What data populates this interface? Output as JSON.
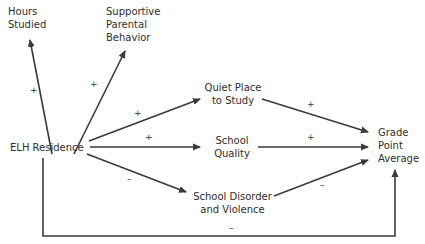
{
  "nodes": {
    "hours_studied": {
      "line1": "Hours",
      "line2": "Studied"
    },
    "supportive_parental": {
      "line1": "Supportive",
      "line2": "Parental",
      "line3": "Behavior"
    },
    "elh_residence": {
      "label": "ELH Residence"
    },
    "quiet_place": {
      "line1": "Quiet Place",
      "line2": "to Study"
    },
    "school_quality": {
      "line1": "School",
      "line2": "Quality"
    },
    "school_disorder": {
      "line1": "School Disorder",
      "line2": "and Violence"
    },
    "gpa": {
      "line1": "Grade",
      "line2": "Point",
      "line3": "Average"
    }
  },
  "edges": [
    {
      "from": "ELH Residence",
      "to": "Hours Studied",
      "sign": "+"
    },
    {
      "from": "ELH Residence",
      "to": "Supportive Parental Behavior",
      "sign": "+"
    },
    {
      "from": "ELH Residence",
      "to": "Quiet Place to Study",
      "sign": "+"
    },
    {
      "from": "ELH Residence",
      "to": "School Quality",
      "sign": "+"
    },
    {
      "from": "ELH Residence",
      "to": "School Disorder and Violence",
      "sign": "–"
    },
    {
      "from": "Quiet Place to Study",
      "to": "Grade Point Average",
      "sign": "+"
    },
    {
      "from": "School Quality",
      "to": "Grade Point Average",
      "sign": "+"
    },
    {
      "from": "School Disorder and Violence",
      "to": "Grade Point Average",
      "sign": "–"
    },
    {
      "from": "ELH Residence",
      "to": "Grade Point Average",
      "sign": "–"
    }
  ],
  "colors": {
    "line": "#3a3a3a",
    "text": "#2e2e2e",
    "background": "#ffffff"
  }
}
